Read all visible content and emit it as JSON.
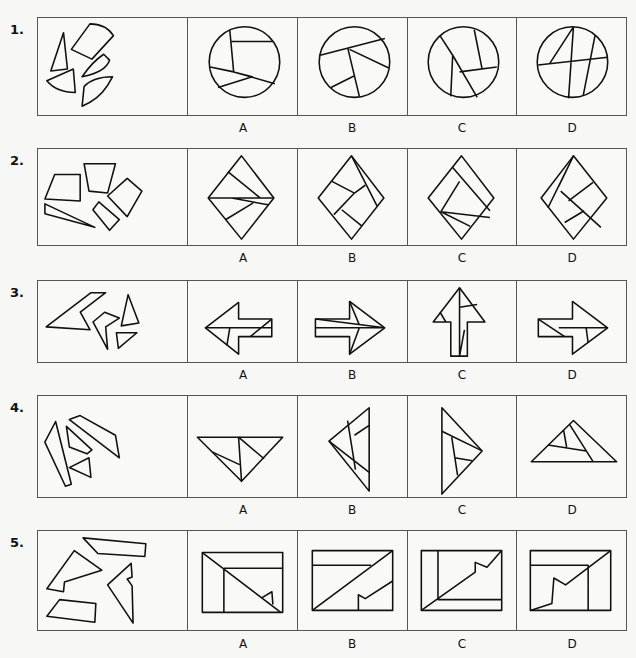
{
  "questions": [
    {
      "number": "1.",
      "options": [
        "A",
        "B",
        "C",
        "D"
      ],
      "target_shape": "circle"
    },
    {
      "number": "2.",
      "options": [
        "A",
        "B",
        "C",
        "D"
      ],
      "target_shape": "diamond"
    },
    {
      "number": "3.",
      "options": [
        "A",
        "B",
        "C",
        "D"
      ],
      "target_shape": "arrow"
    },
    {
      "number": "4.",
      "options": [
        "A",
        "B",
        "C",
        "D"
      ],
      "target_shape": "triangle"
    },
    {
      "number": "5.",
      "options": [
        "A",
        "B",
        "C",
        "D"
      ],
      "target_shape": "rectangle"
    }
  ],
  "colors": {
    "line": "#111111",
    "border": "#555555",
    "background": "#f7f7f5"
  }
}
